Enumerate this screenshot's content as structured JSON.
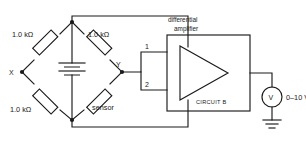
{
  "diagram": {
    "bridge": {
      "resistor_top_left": "1.0 kΩ",
      "resistor_top_right": "1.0 kΩ",
      "resistor_bottom_left": "1.0 kΩ",
      "resistor_bottom_right": "sensor",
      "node_left": "X",
      "node_right": "Y",
      "source": "battery-cell"
    },
    "amplifier": {
      "caption_line1": "differential",
      "caption_line2": "amplifier",
      "input_1": "1",
      "input_2": "2",
      "block_label": "CIRCUIT B"
    },
    "output": {
      "meter_symbol": "V",
      "range_label": "0–10 V",
      "ground": "earth-ground"
    },
    "colors": {
      "ink": "#1a1a1a",
      "background": "#ffffff"
    }
  }
}
